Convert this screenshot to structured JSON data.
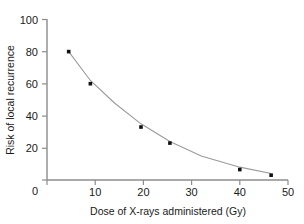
{
  "chart_data": {
    "type": "scatter",
    "title": "",
    "xlabel": "Dose of X-rays administered (Gy)",
    "ylabel": "Risk of local recurrence",
    "xlim": [
      0,
      50
    ],
    "ylim": [
      0,
      100
    ],
    "xticks": [
      0,
      10,
      20,
      30,
      40,
      50
    ],
    "yticks": [
      0,
      20,
      40,
      60,
      80,
      100
    ],
    "xtick_labels": [
      "0",
      "10",
      "20",
      "30",
      "40",
      "50"
    ],
    "ytick_labels": [
      "0",
      "20",
      "40",
      "60",
      "80",
      "100"
    ],
    "grid": false,
    "legend": false,
    "series": [
      {
        "name": "Observed risk",
        "marker": "square",
        "marker_color": "#111111",
        "x": [
          4.5,
          9.0,
          19.5,
          25.5,
          40.0,
          46.5
        ],
        "y": [
          80,
          60,
          33,
          23,
          6.5,
          3
        ]
      },
      {
        "name": "Fitted exponential decay curve",
        "type": "line",
        "line_color": "#9a9a9a",
        "x": [
          4.5,
          9.0,
          14.0,
          19.5,
          25.5,
          32.0,
          40.0,
          46.5
        ],
        "y": [
          80,
          62,
          48,
          35,
          24,
          15,
          8,
          4
        ]
      }
    ]
  },
  "axes": {
    "x_title": "Dose of X-rays administered (Gy)",
    "y_title": "Risk of local recurrence"
  },
  "colors": {
    "marker": "#111111",
    "curve": "#9a9a9a",
    "axis": "#8c8c8c",
    "text": "#1a1a1a",
    "background": "#ffffff"
  }
}
